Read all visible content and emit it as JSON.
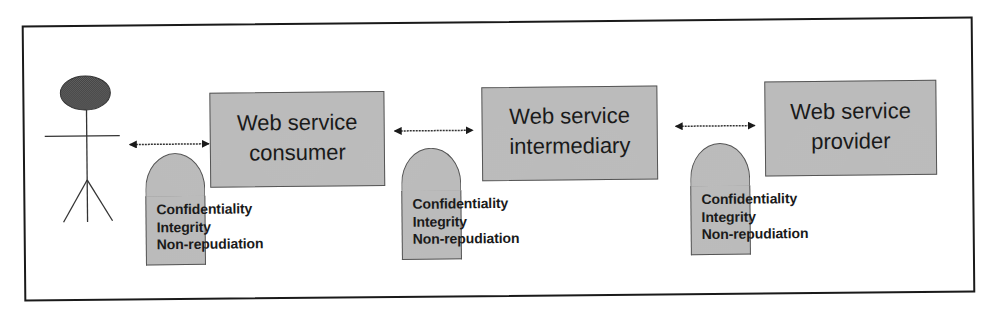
{
  "diagram": {
    "type": "web-service-security-chain",
    "colors": {
      "frame": "#1a1a1a",
      "box_fill": "#c8c8c8",
      "box_border": "#555555",
      "head_fill": "#555555",
      "line": "#333333",
      "text": "#1a1a1a"
    },
    "actor": {
      "name": "user",
      "icon": "stick-figure-icon"
    },
    "nodes": [
      {
        "id": "consumer",
        "label_lines": [
          "Web service",
          "consumer"
        ]
      },
      {
        "id": "intermediary",
        "label_lines": [
          "Web service",
          "intermediary"
        ]
      },
      {
        "id": "provider",
        "label_lines": [
          "Web service",
          "provider"
        ]
      }
    ],
    "links": [
      {
        "from": "user",
        "to": "consumer",
        "style": "bidirectional-arrow"
      },
      {
        "from": "consumer",
        "to": "intermediary",
        "style": "bidirectional-arrow"
      },
      {
        "from": "intermediary",
        "to": "provider",
        "style": "bidirectional-arrow"
      }
    ],
    "shields": [
      {
        "icon": "shield-icon",
        "properties": [
          "Confidentiality",
          "Integrity",
          "Non-repudiation"
        ]
      },
      {
        "icon": "shield-icon",
        "properties": [
          "Confidentiality",
          "Integrity",
          "Non-repudiation"
        ]
      },
      {
        "icon": "shield-icon",
        "properties": [
          "Confidentiality",
          "Integrity",
          "Non-repudiation"
        ]
      }
    ]
  }
}
